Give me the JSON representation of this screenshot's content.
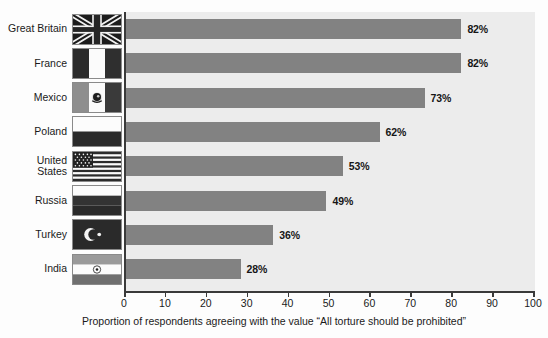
{
  "chart_data": {
    "type": "bar",
    "orientation": "horizontal",
    "title": "",
    "xlabel": "Proportion of respondents agreeing with the value \"All torture should be prohibited\"",
    "ylabel": "",
    "xlim": [
      0,
      100
    ],
    "xticks": [
      0,
      10,
      20,
      30,
      40,
      50,
      60,
      70,
      80,
      90,
      100
    ],
    "grid": false,
    "legend": null,
    "categories": [
      "Great Britain",
      "France",
      "Mexico",
      "Poland",
      "United States",
      "Russia",
      "Turkey",
      "India"
    ],
    "values": [
      82,
      82,
      73,
      62,
      53,
      49,
      36,
      28
    ],
    "data_labels": [
      "82%",
      "82%",
      "73%",
      "62%",
      "53%",
      "49%",
      "36%",
      "28%"
    ],
    "colors": {
      "bar": "#828282",
      "plot_background": "#ececec",
      "axis": "#3a3a3a",
      "text": "#1a1a1a",
      "page_background": "#fdfdfd"
    }
  },
  "rows": [
    {
      "label": "Great Britain",
      "value": 82,
      "data_label": "82%",
      "flag": "flag-great-britain"
    },
    {
      "label": "France",
      "value": 82,
      "data_label": "82%",
      "flag": "flag-france"
    },
    {
      "label": "Mexico",
      "value": 73,
      "data_label": "73%",
      "flag": "flag-mexico"
    },
    {
      "label": "Poland",
      "value": 62,
      "data_label": "62%",
      "flag": "flag-poland"
    },
    {
      "label": "United\nStates",
      "value": 53,
      "data_label": "53%",
      "flag": "flag-united-states"
    },
    {
      "label": "Russia",
      "value": 49,
      "data_label": "49%",
      "flag": "flag-russia"
    },
    {
      "label": "Turkey",
      "value": 36,
      "data_label": "36%",
      "flag": "flag-turkey"
    },
    {
      "label": "India",
      "value": 28,
      "data_label": "28%",
      "flag": "flag-india"
    }
  ],
  "axis": {
    "ticks": [
      "0",
      "10",
      "20",
      "30",
      "40",
      "50",
      "60",
      "70",
      "80",
      "90",
      "100"
    ],
    "caption": "Proportion of respondents agreeing with the value “All torture should be prohibited”"
  }
}
